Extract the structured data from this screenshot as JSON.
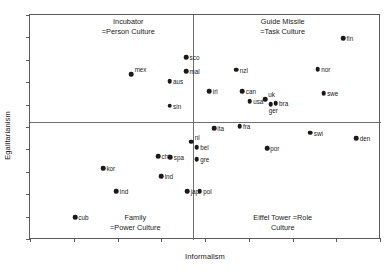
{
  "chart_data": {
    "type": "scatter",
    "title": "",
    "xlabel": "Informalism",
    "ylabel": "Egalitarianism",
    "xlim": [
      0,
      100
    ],
    "ylim": [
      0,
      100
    ],
    "grid": false,
    "legend": null,
    "axis_ticks": {
      "x_tick_count": 9,
      "y_tick_count": 11,
      "x_tick_labels": [],
      "y_tick_labels": []
    },
    "quadrant_dividers": {
      "vertical_x": 46.5,
      "horizontal_y": 52.5
    },
    "quadrant_labels": [
      {
        "name": "incubator",
        "quadrant": "top-left",
        "line1": "Incubator",
        "line2": "=Person Culture",
        "x": 28,
        "y": 95
      },
      {
        "name": "guide-missile",
        "quadrant": "top-right",
        "line1": "Guide Missile",
        "line2": "=Task Culture",
        "x": 72,
        "y": 95
      },
      {
        "name": "family",
        "quadrant": "bottom-left",
        "line1": "Family",
        "line2": "=Power Culture",
        "x": 30,
        "y": 8
      },
      {
        "name": "eiffel-tower",
        "quadrant": "bottom-right",
        "line1": "Eiffel Tower =Role",
        "line2": "Culture",
        "x": 72,
        "y": 8
      }
    ],
    "points": [
      {
        "label": "fin",
        "x": 89.2,
        "y": 89.8,
        "label_side": "right"
      },
      {
        "label": "sco",
        "x": 44.5,
        "y": 81.3,
        "label_side": "right"
      },
      {
        "label": "nor",
        "x": 82.0,
        "y": 76.0,
        "label_side": "right"
      },
      {
        "label": "nzl",
        "x": 58.8,
        "y": 75.6,
        "label_side": "right"
      },
      {
        "label": "mex",
        "x": 28.9,
        "y": 73.8,
        "label_side": "right-up"
      },
      {
        "label": "mal",
        "x": 44.5,
        "y": 75.1,
        "label_side": "right"
      },
      {
        "label": "aus",
        "x": 39.8,
        "y": 70.7,
        "label_side": "right"
      },
      {
        "label": "irl",
        "x": 51.1,
        "y": 66.2,
        "label_side": "right"
      },
      {
        "label": "can",
        "x": 60.5,
        "y": 66.2,
        "label_side": "right"
      },
      {
        "label": "swe",
        "x": 83.7,
        "y": 65.3,
        "label_side": "right"
      },
      {
        "label": "usa",
        "x": 62.6,
        "y": 61.8,
        "label_side": "right"
      },
      {
        "label": "uk",
        "x": 67.0,
        "y": 62.7,
        "label_side": "right-up"
      },
      {
        "label": "bra",
        "x": 70.0,
        "y": 60.9,
        "label_side": "right"
      },
      {
        "label": "ger",
        "x": 68.6,
        "y": 60.4,
        "label_side": "below"
      },
      {
        "label": "sin",
        "x": 39.8,
        "y": 59.6,
        "label_side": "right"
      },
      {
        "label": "fra",
        "x": 59.7,
        "y": 50.7,
        "label_side": "right"
      },
      {
        "label": "ita",
        "x": 52.4,
        "y": 49.8,
        "label_side": "right"
      },
      {
        "label": "swi",
        "x": 79.9,
        "y": 47.6,
        "label_side": "right"
      },
      {
        "label": "den",
        "x": 93.0,
        "y": 45.3,
        "label_side": "right"
      },
      {
        "label": "nl",
        "x": 46.0,
        "y": 43.6,
        "label_side": "right-up"
      },
      {
        "label": "bel",
        "x": 47.5,
        "y": 41.3,
        "label_side": "right"
      },
      {
        "label": "por",
        "x": 67.5,
        "y": 40.9,
        "label_side": "right"
      },
      {
        "label": "chi",
        "x": 36.5,
        "y": 37.3,
        "label_side": "right"
      },
      {
        "label": "spa",
        "x": 40.0,
        "y": 36.9,
        "label_side": "right"
      },
      {
        "label": "gre",
        "x": 47.5,
        "y": 36.0,
        "label_side": "right"
      },
      {
        "label": "kor",
        "x": 20.8,
        "y": 32.0,
        "label_side": "right"
      },
      {
        "label": "ind",
        "x": 37.4,
        "y": 28.4,
        "label_side": "right"
      },
      {
        "label": "ind",
        "x": 24.6,
        "y": 21.8,
        "label_side": "right"
      },
      {
        "label": "jap",
        "x": 44.8,
        "y": 21.8,
        "label_side": "right"
      },
      {
        "label": "pol",
        "x": 48.4,
        "y": 21.8,
        "label_side": "right"
      },
      {
        "label": "cub",
        "x": 12.8,
        "y": 10.2,
        "label_side": "right"
      }
    ]
  }
}
